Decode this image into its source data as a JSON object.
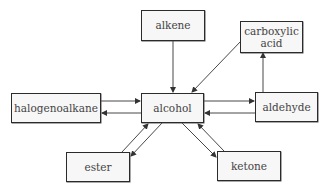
{
  "diagram": {
    "type": "reaction-map",
    "center": "alcohol",
    "nodes": [
      {
        "id": "alkene",
        "label": "alkene"
      },
      {
        "id": "carboxylic_acid",
        "label": "carboxylic\nacid"
      },
      {
        "id": "halogenoalkane",
        "label": "halogenoalkane"
      },
      {
        "id": "alcohol",
        "label": "alcohol"
      },
      {
        "id": "aldehyde",
        "label": "aldehyde"
      },
      {
        "id": "ester",
        "label": "ester"
      },
      {
        "id": "ketone",
        "label": "ketone"
      }
    ],
    "edges": [
      {
        "from": "alkene",
        "to": "alcohol"
      },
      {
        "from": "carboxylic_acid",
        "to": "alcohol"
      },
      {
        "from": "aldehyde",
        "to": "carboxylic_acid"
      },
      {
        "from": "halogenoalkane",
        "to": "alcohol"
      },
      {
        "from": "alcohol",
        "to": "halogenoalkane"
      },
      {
        "from": "alcohol",
        "to": "aldehyde"
      },
      {
        "from": "aldehyde",
        "to": "alcohol"
      },
      {
        "from": "alcohol",
        "to": "ester"
      },
      {
        "from": "ester",
        "to": "alcohol"
      },
      {
        "from": "alcohol",
        "to": "ketone"
      },
      {
        "from": "ketone",
        "to": "alcohol"
      }
    ]
  },
  "colors": {
    "border": "#2b2b2b",
    "box_fill": "#f7f7f7",
    "text": "#444444",
    "arrow": "#333333"
  }
}
